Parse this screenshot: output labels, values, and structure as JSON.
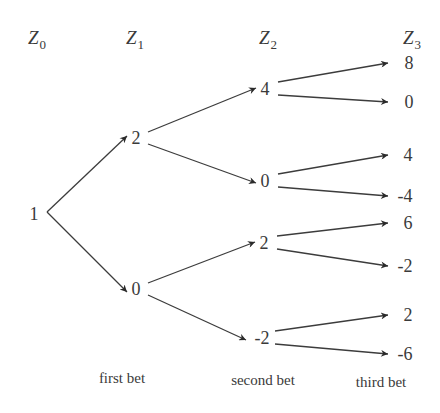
{
  "title_fragment": "",
  "column_headers": [
    {
      "var": "Z",
      "sub": "0"
    },
    {
      "var": "Z",
      "sub": "1"
    },
    {
      "var": "Z",
      "sub": "2"
    },
    {
      "var": "Z",
      "sub": "3"
    }
  ],
  "tree": {
    "root": "1",
    "level1": [
      "2",
      "0"
    ],
    "level2": [
      "4",
      "0",
      "2",
      "-2"
    ],
    "level3": [
      "8",
      "0",
      "4",
      "-4",
      "6",
      "-2",
      "2",
      "-6"
    ]
  },
  "bet_labels": [
    "first bet",
    "second bet",
    "third bet"
  ],
  "colors": {
    "line": "#3c3c3c",
    "text": "#3a3a3a"
  }
}
